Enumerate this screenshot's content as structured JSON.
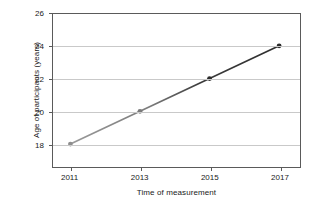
{
  "chart_data": {
    "type": "line",
    "title": "",
    "xlabel": "Time of measurement",
    "ylabel": "Age of participants (years)",
    "x": [
      2011,
      2013,
      2015,
      2017
    ],
    "xticklabels": [
      "2011",
      "2013",
      "2015",
      "2017"
    ],
    "yticklabels": [
      "18",
      "20",
      "22",
      "24",
      "26"
    ],
    "yticks": [
      18,
      20,
      22,
      24,
      26
    ],
    "xlim": [
      2010.5,
      2017.6
    ],
    "ylim": [
      16.6,
      26
    ],
    "grid": true,
    "grid_axis": "y",
    "legend": false,
    "series": [
      {
        "name": "Age of participants",
        "values": [
          18,
          20,
          22,
          24
        ],
        "line_color": "#4a4a4a",
        "marker_colors": [
          "#8e8e8e",
          "#7a7a7a",
          "#2b2b2b",
          "#2b2b2b"
        ]
      }
    ],
    "colors": {
      "axis": "#5a5a5a",
      "grid": "#c9c9c9",
      "text": "#1a1a1a",
      "background": "#ffffff",
      "line_light": "#8e8e8e",
      "line_dark": "#333333"
    }
  }
}
